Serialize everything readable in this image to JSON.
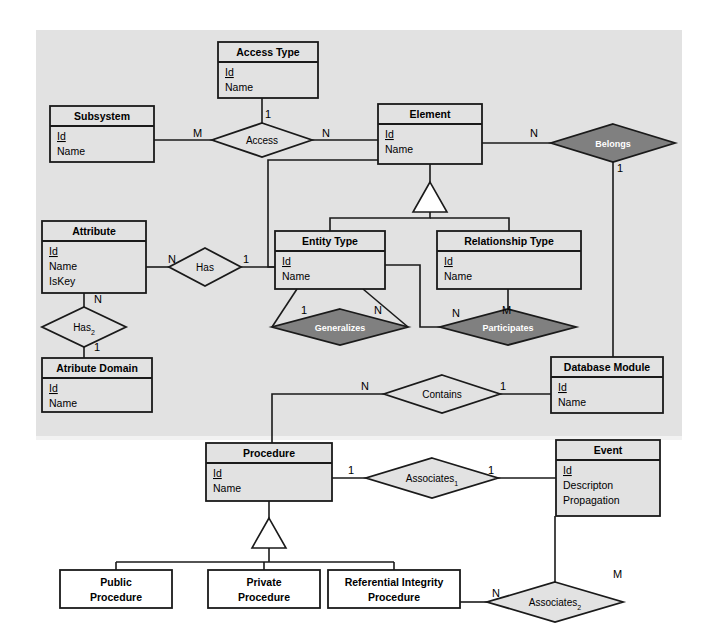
{
  "diagram": {
    "type": "entity-relationship-diagram",
    "title": "",
    "background_upper_region_color": "#e2e2e2",
    "background_color": "#ffffff",
    "shaded_diamond_color": "#808080",
    "plain_diamond_color": "#e2e2e2",
    "entity_fill_color": "#e2e2e2",
    "line_color": "#1a1a1a"
  },
  "entities": [
    {
      "id": "access_type",
      "name": "Access Type",
      "attributes": [
        "Id",
        "Name"
      ],
      "key_attribute": "Id",
      "x": 218,
      "y": 42,
      "w": 100,
      "h": 56
    },
    {
      "id": "subsystem",
      "name": "Subsystem",
      "attributes": [
        "Id",
        "Name"
      ],
      "key_attribute": "Id",
      "x": 50,
      "y": 106,
      "w": 104,
      "h": 56
    },
    {
      "id": "element",
      "name": "Element",
      "attributes": [
        "Id",
        "Name"
      ],
      "key_attribute": "Id",
      "x": 378,
      "y": 104,
      "w": 104,
      "h": 60
    },
    {
      "id": "attribute",
      "name": "Attribute",
      "attributes": [
        "Id",
        "Name",
        "IsKey"
      ],
      "key_attribute": "Id",
      "x": 42,
      "y": 221,
      "w": 104,
      "h": 72
    },
    {
      "id": "entity_type",
      "name": "Entity Type",
      "attributes": [
        "Id",
        "Name"
      ],
      "key_attribute": "Id",
      "x": 275,
      "y": 231,
      "w": 110,
      "h": 58
    },
    {
      "id": "relationship_type",
      "name": "Relationship Type",
      "attributes": [
        "Id",
        "Name"
      ],
      "key_attribute": "Id",
      "x": 437,
      "y": 231,
      "w": 144,
      "h": 58
    },
    {
      "id": "atribute_domain",
      "name": "Atribute Domain",
      "attributes": [
        "Id",
        "Name"
      ],
      "key_attribute": "Id",
      "x": 42,
      "y": 358,
      "w": 110,
      "h": 54
    },
    {
      "id": "database_module",
      "name": "Database Module",
      "attributes": [
        "Id",
        "Name"
      ],
      "key_attribute": "Id",
      "x": 551,
      "y": 357,
      "w": 112,
      "h": 56
    },
    {
      "id": "procedure",
      "name": "Procedure",
      "attributes": [
        "Id",
        "Name"
      ],
      "key_attribute": "Id",
      "x": 206,
      "y": 443,
      "w": 126,
      "h": 58
    },
    {
      "id": "event",
      "name": "Event",
      "attributes": [
        "Id",
        "Descripton",
        "Propagation"
      ],
      "key_attribute": "Id",
      "x": 556,
      "y": 440,
      "w": 104,
      "h": 76
    }
  ],
  "subtype_boxes": [
    {
      "id": "public_procedure",
      "line1": "Public",
      "line2": "Procedure",
      "x": 60,
      "y": 570,
      "w": 112,
      "h": 38
    },
    {
      "id": "private_procedure",
      "line1": "Private",
      "line2": "Procedure",
      "x": 208,
      "y": 570,
      "w": 112,
      "h": 38
    },
    {
      "id": "referential_integrity_procedure",
      "line1": "Referential Integrity",
      "line2": "Procedure",
      "x": 328,
      "y": 570,
      "w": 132,
      "h": 38
    }
  ],
  "relationships": [
    {
      "id": "access",
      "label": "Access",
      "shaded": false,
      "cx": 262,
      "cy": 140,
      "rx": 50,
      "ry": 17
    },
    {
      "id": "belongs",
      "label": "Belongs",
      "shaded": true,
      "cx": 613,
      "cy": 143,
      "rx": 62,
      "ry": 19
    },
    {
      "id": "has",
      "label": "Has",
      "shaded": false,
      "cx": 205,
      "cy": 267,
      "rx": 36,
      "ry": 19
    },
    {
      "id": "has2",
      "label": "Has",
      "label_sub": "2",
      "shaded": false,
      "cx": 84,
      "cy": 327,
      "rx": 42,
      "ry": 20
    },
    {
      "id": "generalizes",
      "label": "Generalizes",
      "shaded": true,
      "cx": 340,
      "cy": 327,
      "rx": 68,
      "ry": 18
    },
    {
      "id": "participates",
      "label": "Participates",
      "shaded": true,
      "cx": 508,
      "cy": 327,
      "rx": 68,
      "ry": 18
    },
    {
      "id": "contains",
      "label": "Contains",
      "shaded": false,
      "cx": 442,
      "cy": 394,
      "rx": 58,
      "ry": 19
    },
    {
      "id": "associates1",
      "label": "Associates",
      "label_sub": "1",
      "shaded": false,
      "cx": 432,
      "cy": 478,
      "rx": 66,
      "ry": 20
    },
    {
      "id": "associates2",
      "label": "Associates",
      "label_sub": "2",
      "shaded": false,
      "cx": 555,
      "cy": 602,
      "rx": 68,
      "ry": 20
    }
  ],
  "cardinalities": [
    {
      "id": "card-access-subsystem",
      "text": "M",
      "x": 193,
      "y": 137
    },
    {
      "id": "card-access-accesstype",
      "text": "1",
      "x": 265,
      "y": 118
    },
    {
      "id": "card-access-element",
      "text": "N",
      "x": 322,
      "y": 137
    },
    {
      "id": "card-belongs-element",
      "text": "N",
      "x": 530,
      "y": 137
    },
    {
      "id": "card-belongs-dbmodule",
      "text": "1",
      "x": 617,
      "y": 172
    },
    {
      "id": "card-has-attribute",
      "text": "N",
      "x": 168,
      "y": 263
    },
    {
      "id": "card-has-entitytype",
      "text": "1",
      "x": 243,
      "y": 263
    },
    {
      "id": "card-has2-attribute",
      "text": "N",
      "x": 94,
      "y": 303
    },
    {
      "id": "card-has2-domain",
      "text": "1",
      "x": 94,
      "y": 351
    },
    {
      "id": "card-generalizes-1",
      "text": "1",
      "x": 301,
      "y": 314
    },
    {
      "id": "card-generalizes-n",
      "text": "N",
      "x": 374,
      "y": 314
    },
    {
      "id": "card-participates-n",
      "text": "N",
      "x": 452,
      "y": 317
    },
    {
      "id": "card-participates-m",
      "text": "M",
      "x": 502,
      "y": 314
    },
    {
      "id": "card-contains-n",
      "text": "N",
      "x": 361,
      "y": 390
    },
    {
      "id": "card-contains-1",
      "text": "1",
      "x": 500,
      "y": 390
    },
    {
      "id": "card-assoc1-procedure",
      "text": "1",
      "x": 348,
      "y": 474
    },
    {
      "id": "card-assoc1-event",
      "text": "1",
      "x": 488,
      "y": 474
    },
    {
      "id": "card-assoc2-event",
      "text": "M",
      "x": 613,
      "y": 578
    },
    {
      "id": "card-assoc2-refint",
      "text": "N",
      "x": 492,
      "y": 597
    }
  ],
  "generalization_triangles": [
    {
      "id": "element-generalization",
      "apex_x": 430,
      "apex_y": 182,
      "base_y": 212,
      "half_w": 17
    },
    {
      "id": "procedure-generalization",
      "apex_x": 269,
      "apex_y": 518,
      "base_y": 548,
      "half_w": 17
    }
  ]
}
